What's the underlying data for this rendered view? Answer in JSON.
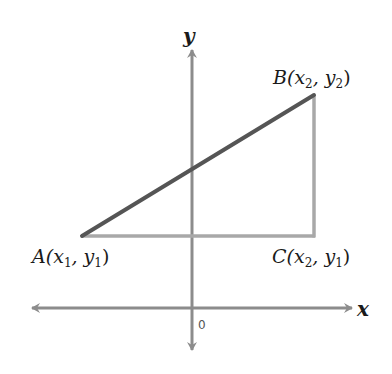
{
  "diagram": {
    "type": "coordinate-plane right triangle",
    "axes": {
      "x_label": "x",
      "y_label": "y",
      "origin_label": "0",
      "color": "#8c8c8c"
    },
    "points": {
      "A": {
        "name": "A",
        "coord_text": "(x",
        "sub1": "1",
        "sep": ", y",
        "sub2": "1",
        "close": ")"
      },
      "B": {
        "name": "B",
        "coord_text": "(x",
        "sub1": "2",
        "sep": ", y",
        "sub2": "2",
        "close": ")"
      },
      "C": {
        "name": "C",
        "coord_text": "(x",
        "sub1": "2",
        "sep": ", y",
        "sub2": "1",
        "close": ")"
      }
    },
    "segments": {
      "AB": {
        "color": "#555555",
        "description": "hypotenuse from A to B"
      },
      "AC": {
        "color": "#a8a8a8",
        "description": "horizontal leg from A to C"
      },
      "CB": {
        "color": "#a8a8a8",
        "description": "vertical leg from C to B"
      }
    }
  }
}
